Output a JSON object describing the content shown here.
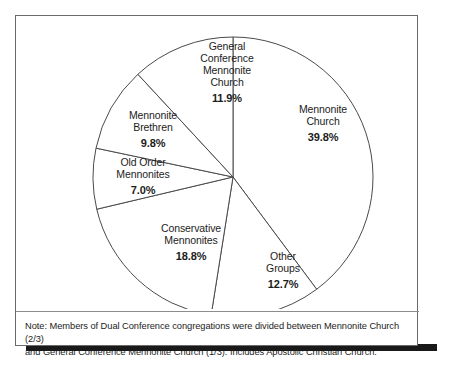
{
  "figure": {
    "note_lines": [
      "Note: Members of Dual Conference congregations were divided between Mennonite Church (2/3)",
      "and General Conference Mennonite Church (1/3). Includes Apostolic Christian Church."
    ]
  },
  "chart_data": {
    "type": "pie",
    "title": "",
    "xlabel": "",
    "ylabel": "",
    "legend": "none",
    "grid": false,
    "units": "percent",
    "start_angle_deg": 0,
    "direction": "clockwise",
    "center": {
      "x": 233,
      "y": 177
    },
    "radius": 140,
    "categories": [
      "Mennonite Church",
      "Other Groups",
      "Conservative Mennonites",
      "Old Order Mennonites",
      "Mennonite Brethren",
      "General Conference Mennonite Church"
    ],
    "values": [
      39.8,
      12.7,
      18.8,
      7.0,
      9.8,
      11.9
    ],
    "slices": [
      {
        "name": "Mennonite Church",
        "label_lines": [
          "Mennonite",
          "Church"
        ],
        "value": 39.8,
        "value_label": "39.8%",
        "start_deg": 0.0,
        "end_deg": 143.3,
        "fill": "#ffffff",
        "stroke": "#4a4a4a"
      },
      {
        "name": "Other Groups",
        "label_lines": [
          "Other",
          "Groups"
        ],
        "value": 12.7,
        "value_label": "12.7%",
        "start_deg": 143.3,
        "end_deg": 189.0,
        "fill": "#ffffff",
        "stroke": "#4a4a4a"
      },
      {
        "name": "Conservative Mennonites",
        "label_lines": [
          "Conservative",
          "Mennonites"
        ],
        "value": 18.8,
        "value_label": "18.8%",
        "start_deg": 189.0,
        "end_deg": 256.7,
        "fill": "#ffffff",
        "stroke": "#4a4a4a"
      },
      {
        "name": "Old Order Mennonites",
        "label_lines": [
          "Old Order",
          "Mennonites"
        ],
        "value": 7.0,
        "value_label": "7.0%",
        "start_deg": 256.7,
        "end_deg": 281.9,
        "fill": "#ffffff",
        "stroke": "#4a4a4a"
      },
      {
        "name": "Mennonite Brethren",
        "label_lines": [
          "Mennonite",
          "Brethren"
        ],
        "value": 9.8,
        "value_label": "9.8%",
        "start_deg": 281.9,
        "end_deg": 317.2,
        "fill": "#ffffff",
        "stroke": "#4a4a4a"
      },
      {
        "name": "General Conference Mennonite Church",
        "label_lines": [
          "General",
          "Conference",
          "Mennonite",
          "Church"
        ],
        "value": 11.9,
        "value_label": "11.9%",
        "start_deg": 317.2,
        "end_deg": 360.0,
        "fill": "#ffffff",
        "stroke": "#4a4a4a"
      }
    ]
  },
  "labels": {
    "general_conference": {
      "line1": "General",
      "line2": "Conference",
      "line3": "Mennonite",
      "line4": "Church",
      "value": "11.9%"
    },
    "mennonite_church": {
      "line1": "Mennonite",
      "line2": "Church",
      "value": "39.8%"
    },
    "mennonite_brethren": {
      "line1": "Mennonite",
      "line2": "Brethren",
      "value": "9.8%"
    },
    "old_order": {
      "line1": "Old Order",
      "line2": "Mennonites",
      "value": "7.0%"
    },
    "conservative": {
      "line1": "Conservative",
      "line2": "Mennonites",
      "value": "18.8%"
    },
    "other_groups": {
      "line1": "Other",
      "line2": "Groups",
      "value": "12.7%"
    }
  },
  "colors": {
    "frame_border": "#6a6a6a",
    "pie_stroke": "#4a4a4a",
    "pie_fill": "#ffffff",
    "text": "#1c1c1c",
    "shadow": "#191919",
    "background": "#ffffff"
  }
}
